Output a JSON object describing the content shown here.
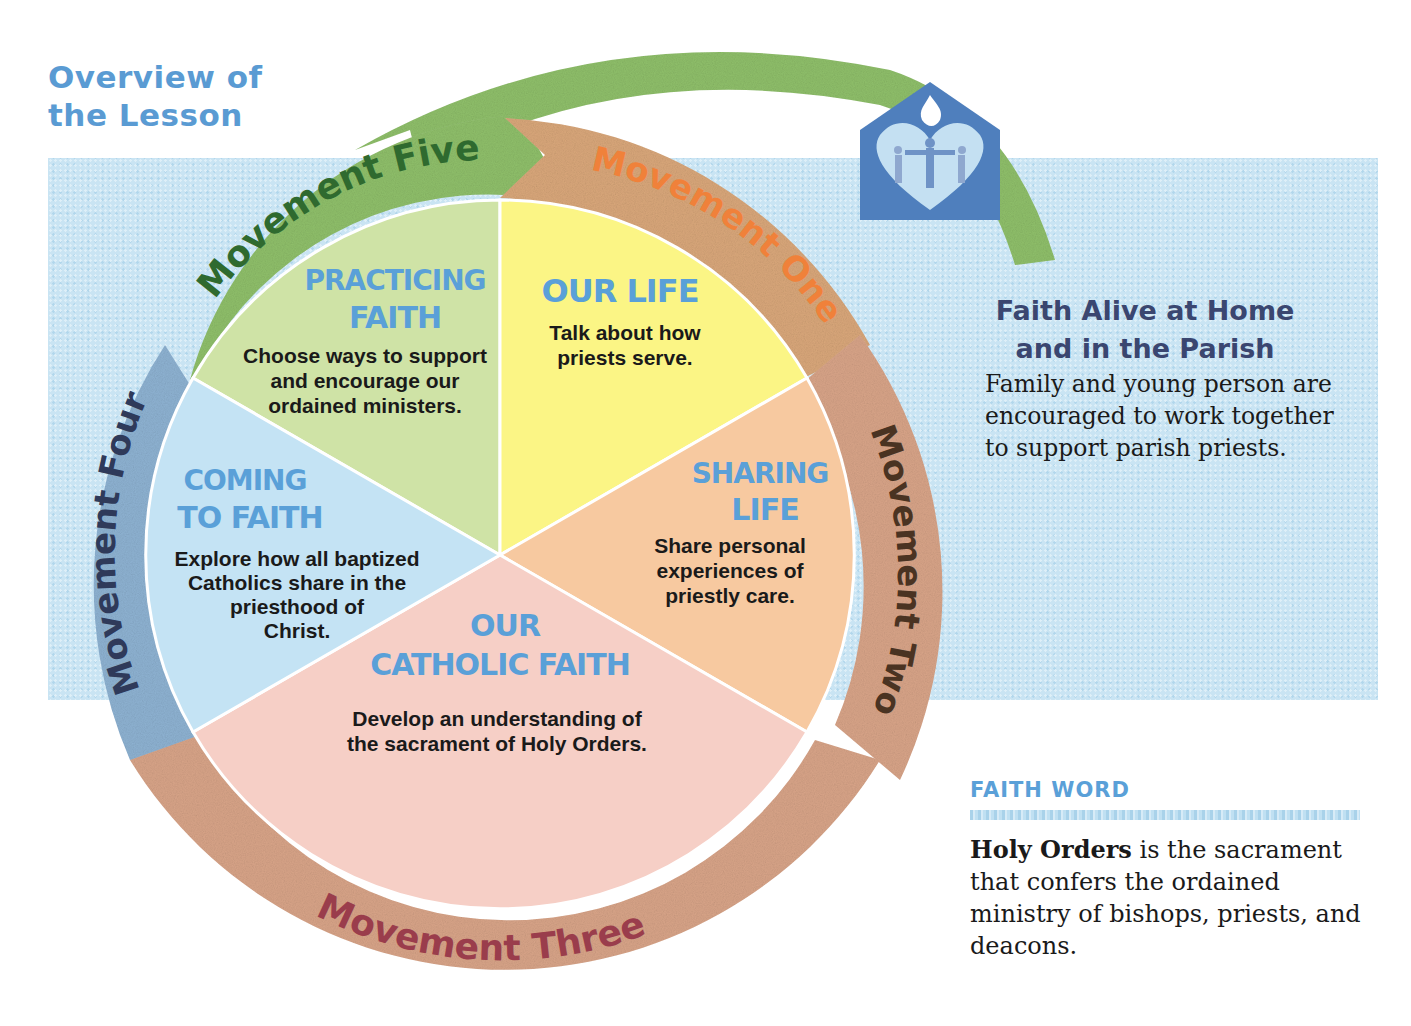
{
  "page": {
    "title_line1": "Overview of",
    "title_line2": "the Lesson"
  },
  "colors": {
    "title_blue": "#5a9bd3",
    "background_band": "#c9e4f3",
    "wedge_practicing_faith": "#cfe3a6",
    "wedge_our_life": "#fbf585",
    "wedge_sharing_life": "#f7c9a0",
    "wedge_our_catholic_faith": "#f6cfc6",
    "wedge_coming_to_faith": "#c4e3f4",
    "ring_green": "#8fbf6a",
    "ring_orange": "#d9a77a",
    "ring_tan": "#d8a488",
    "ring_blue": "#8eb2d2",
    "movement_one_text": "#f0813a",
    "movement_two_text": "#4a3322",
    "movement_three_text": "#9a3d4c",
    "movement_four_text": "#2f3a5a",
    "movement_five_text": "#2f6a2f",
    "logo_blue": "#4f7fbd"
  },
  "movements": [
    {
      "id": "one",
      "label": "Movement One"
    },
    {
      "id": "two",
      "label": "Movement Two"
    },
    {
      "id": "three",
      "label": "Movement Three"
    },
    {
      "id": "four",
      "label": "Movement Four"
    },
    {
      "id": "five",
      "label": "Movement Five"
    }
  ],
  "wedges": {
    "our_life": {
      "title": "OUR LIFE",
      "lines": [
        "Talk about how",
        "priests serve."
      ]
    },
    "sharing_life": {
      "title_line1": "SHARING",
      "title_line2": "LIFE",
      "lines": [
        "Share personal",
        "experiences of",
        "priestly care."
      ]
    },
    "our_catholic_faith": {
      "title_line1": "OUR",
      "title_line2": "CATHOLIC FAITH",
      "lines": [
        "Develop an understanding of",
        "the sacrament of Holy Orders."
      ]
    },
    "coming_to_faith": {
      "title_line1": "COMING",
      "title_line2": "TO FAITH",
      "lines": [
        "Explore how all baptized",
        "Catholics share in the",
        "priesthood of",
        "Christ."
      ]
    },
    "practicing_faith": {
      "title_line1": "PRACTICING",
      "title_line2": "FAITH",
      "lines": [
        "Choose ways to support",
        "and encourage our",
        "ordained ministers."
      ]
    }
  },
  "logo": {
    "icon": "home-heart-dove-icon"
  },
  "faith_alive": {
    "heading_line1": "Faith Alive at Home",
    "heading_line2": "and in the Parish",
    "body": "Family and young person are encouraged to work together to support parish priests."
  },
  "faith_word": {
    "label": "FAITH WORD",
    "term": "Holy Orders",
    "definition": " is the sacrament that confers the ordained ministry of bishops, priests, and deacons."
  }
}
